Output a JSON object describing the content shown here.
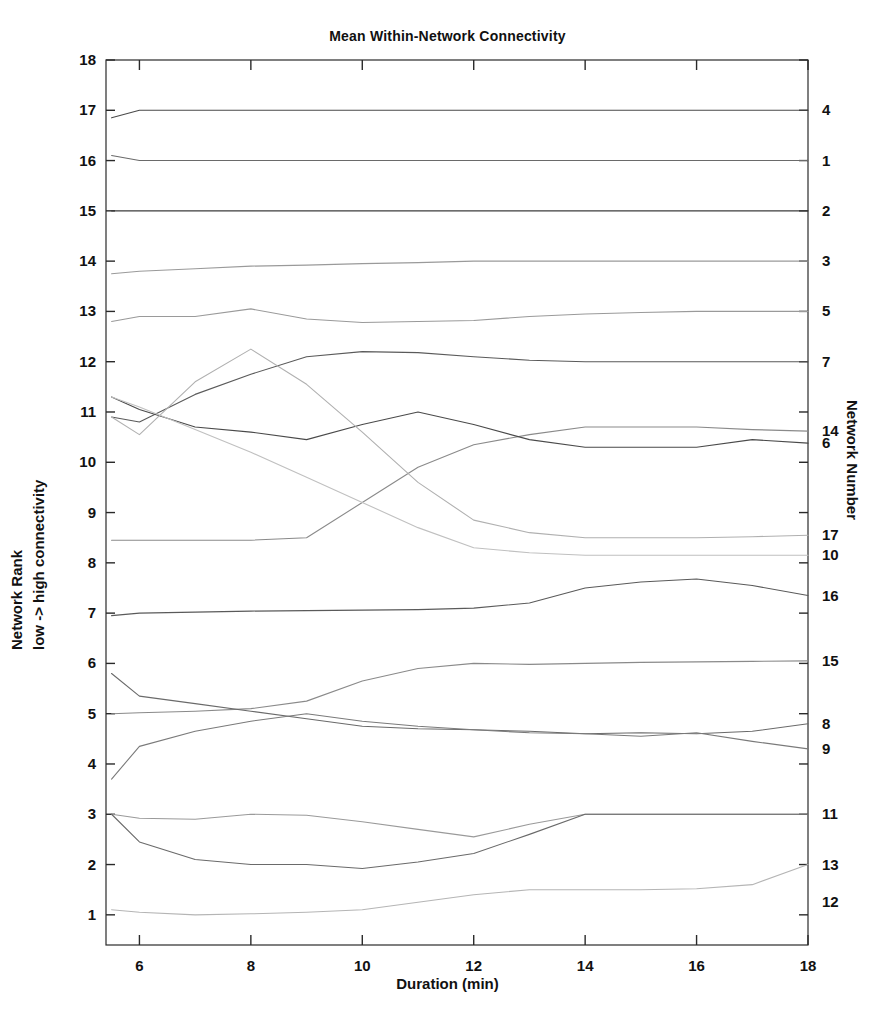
{
  "chart_data": {
    "type": "line",
    "title": "Mean Within-Network Connectivity",
    "xlabel": "Duration (min)",
    "ylabel": "Network Rank  low -> high connectivity",
    "ylabel_line1": "Network Rank",
    "ylabel_line2": "low -> high connectivity",
    "ylabel_right": "Network Number",
    "grid": false,
    "legend": "none",
    "xlim": [
      5.4,
      18
    ],
    "ylim": [
      0.4,
      18
    ],
    "xticks": [
      6,
      8,
      10,
      12,
      14,
      16,
      18
    ],
    "yticks": [
      1,
      2,
      3,
      4,
      5,
      6,
      7,
      8,
      9,
      10,
      11,
      12,
      13,
      14,
      15,
      16,
      17,
      18
    ],
    "right_axis_labels": [
      {
        "network": "4",
        "rank": 17.0
      },
      {
        "network": "1",
        "rank": 16.0
      },
      {
        "network": "2",
        "rank": 15.0
      },
      {
        "network": "3",
        "rank": 14.0
      },
      {
        "network": "5",
        "rank": 13.0
      },
      {
        "network": "7",
        "rank": 12.0
      },
      {
        "network": "14",
        "rank": 10.62
      },
      {
        "network": "6",
        "rank": 10.38
      },
      {
        "network": "17",
        "rank": 8.55
      },
      {
        "network": "10",
        "rank": 8.15
      },
      {
        "network": "16",
        "rank": 7.35
      },
      {
        "network": "15",
        "rank": 6.05
      },
      {
        "network": "8",
        "rank": 4.8
      },
      {
        "network": "9",
        "rank": 4.3
      },
      {
        "network": "11",
        "rank": 3.0
      },
      {
        "network": "13",
        "rank": 2.0
      },
      {
        "network": "12",
        "rank": 1.25
      }
    ],
    "x": [
      5.5,
      6,
      7,
      8,
      9,
      10,
      11,
      12,
      13,
      14,
      15,
      16,
      17,
      18
    ],
    "series": [
      {
        "name": "4",
        "network": 4,
        "color": "#4a4a4a",
        "values": [
          16.85,
          17.0,
          17.0,
          17.0,
          17.0,
          17.0,
          17.0,
          17.0,
          17.0,
          17.0,
          17.0,
          17.0,
          17.0,
          17.0
        ]
      },
      {
        "name": "1",
        "network": 1,
        "color": "#6a6a6a",
        "values": [
          16.1,
          16.0,
          16.0,
          16.0,
          16.0,
          16.0,
          16.0,
          16.0,
          16.0,
          16.0,
          16.0,
          16.0,
          16.0,
          16.0
        ]
      },
      {
        "name": "2",
        "network": 2,
        "color": "#3c3c3c",
        "values": [
          15.0,
          15.0,
          15.0,
          15.0,
          15.0,
          15.0,
          15.0,
          15.0,
          15.0,
          15.0,
          15.0,
          15.0,
          15.0,
          15.0
        ]
      },
      {
        "name": "3",
        "network": 3,
        "color": "#9a9a9a",
        "values": [
          13.75,
          13.8,
          13.85,
          13.9,
          13.92,
          13.95,
          13.97,
          14.0,
          14.0,
          14.0,
          14.0,
          14.0,
          14.0,
          14.0
        ]
      },
      {
        "name": "5",
        "network": 5,
        "color": "#9a9a9a",
        "values": [
          12.8,
          12.9,
          12.9,
          13.05,
          12.85,
          12.78,
          12.8,
          12.82,
          12.9,
          12.95,
          12.98,
          13.0,
          13.0,
          13.0
        ]
      },
      {
        "name": "7",
        "network": 7,
        "color": "#5a5a5a",
        "values": [
          10.9,
          10.8,
          11.35,
          11.75,
          12.1,
          12.2,
          12.18,
          12.1,
          12.03,
          12.0,
          12.0,
          12.0,
          12.0,
          12.0
        ]
      },
      {
        "name": "14",
        "network": 14,
        "color": "#8a8a8a",
        "values": [
          8.45,
          8.45,
          8.45,
          8.45,
          8.5,
          9.2,
          9.9,
          10.35,
          10.55,
          10.7,
          10.7,
          10.7,
          10.65,
          10.62
        ]
      },
      {
        "name": "6",
        "network": 6,
        "color": "#4a4a4a",
        "values": [
          11.3,
          11.05,
          10.7,
          10.6,
          10.45,
          10.75,
          11.0,
          10.75,
          10.45,
          10.3,
          10.3,
          10.3,
          10.45,
          10.38
        ]
      },
      {
        "name": "17",
        "network": 17,
        "color": "#b0b0b0",
        "values": [
          10.9,
          10.55,
          11.6,
          12.25,
          11.55,
          10.6,
          9.6,
          8.85,
          8.6,
          8.5,
          8.5,
          8.5,
          8.52,
          8.55
        ]
      },
      {
        "name": "10",
        "network": 10,
        "color": "#c0c0c0",
        "values": [
          11.3,
          11.1,
          10.65,
          10.2,
          9.7,
          9.2,
          8.7,
          8.3,
          8.2,
          8.15,
          8.15,
          8.15,
          8.15,
          8.15
        ]
      },
      {
        "name": "16",
        "network": 16,
        "color": "#5a5a5a",
        "values": [
          6.95,
          7.0,
          7.02,
          7.04,
          7.05,
          7.06,
          7.07,
          7.1,
          7.2,
          7.5,
          7.62,
          7.68,
          7.55,
          7.35
        ]
      },
      {
        "name": "15",
        "network": 15,
        "color": "#8a8a8a",
        "values": [
          5.0,
          5.02,
          5.05,
          5.1,
          5.25,
          5.65,
          5.9,
          6.0,
          5.98,
          6.0,
          6.02,
          6.03,
          6.04,
          6.05
        ]
      },
      {
        "name": "8",
        "network": 8,
        "color": "#6a6a6a",
        "values": [
          5.8,
          5.35,
          5.2,
          5.05,
          4.9,
          4.75,
          4.7,
          4.68,
          4.65,
          4.6,
          4.62,
          4.6,
          4.65,
          4.8
        ]
      },
      {
        "name": "9",
        "network": 9,
        "color": "#7a7a7a",
        "values": [
          3.7,
          4.35,
          4.65,
          4.85,
          5.0,
          4.85,
          4.75,
          4.68,
          4.62,
          4.6,
          4.55,
          4.62,
          4.45,
          4.3
        ]
      },
      {
        "name": "11",
        "network": 11,
        "color": "#9a9a9a",
        "values": [
          3.0,
          2.92,
          2.9,
          3.0,
          2.98,
          2.85,
          2.7,
          2.55,
          2.8,
          3.0,
          3.0,
          3.0,
          3.0,
          3.0
        ]
      },
      {
        "name": "13",
        "network": 13,
        "color": "#6a6a6a",
        "values": [
          3.0,
          2.45,
          2.1,
          2.0,
          2.0,
          1.92,
          2.05,
          2.22,
          2.6,
          3.0,
          3.0,
          3.0,
          3.0,
          3.0
        ]
      },
      {
        "name": "12",
        "network": 12,
        "color": "#b5b5b5",
        "values": [
          1.1,
          1.05,
          1.0,
          1.02,
          1.05,
          1.1,
          1.25,
          1.4,
          1.5,
          1.5,
          1.5,
          1.52,
          1.6,
          2.0
        ]
      }
    ]
  }
}
